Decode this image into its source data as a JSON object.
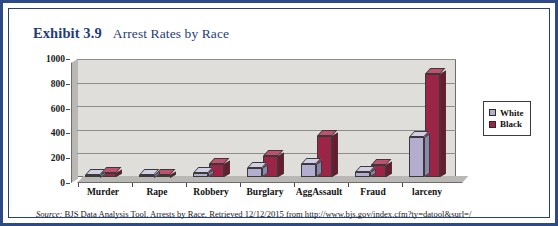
{
  "figure": {
    "exhibit_number": "Exhibit 3.9",
    "caption": "Arrest Rates by Race",
    "source_label": "Source:",
    "source_text": " BJS Data Analysis Tool. Arrests by Race. Retrieved 12/12/2015 from http://www.bjs.gov/index.cfm?ty=datool&surl=/",
    "frame_color": "#2e4a86",
    "title_color": "#1f3d7a"
  },
  "chart_data": {
    "type": "bar",
    "title": "Arrest Rates by Race",
    "xlabel": "",
    "ylabel": "",
    "categories": [
      "Murder",
      "Rape",
      "Robbery",
      "Burglary",
      "AggAssault",
      "Fraud",
      "larceny"
    ],
    "series": [
      {
        "name": "White",
        "color": "#b3aed0",
        "values": [
          10,
          15,
          30,
          80,
          110,
          40,
          340
        ]
      },
      {
        "name": "Black",
        "color": "#9c2547",
        "values": [
          30,
          15,
          110,
          180,
          350,
          100,
          870
        ]
      }
    ],
    "ylim": [
      0,
      1000
    ],
    "ytick_values": [
      0,
      200,
      400,
      600,
      800,
      1000
    ],
    "ytick_labels": [
      "0",
      "200",
      "400",
      "600",
      "800",
      "1000"
    ],
    "grid": true,
    "legend_position": "right",
    "legend_entries": [
      {
        "label": "White",
        "color": "#b3aed0"
      },
      {
        "label": "Black",
        "color": "#9c2547"
      }
    ]
  }
}
